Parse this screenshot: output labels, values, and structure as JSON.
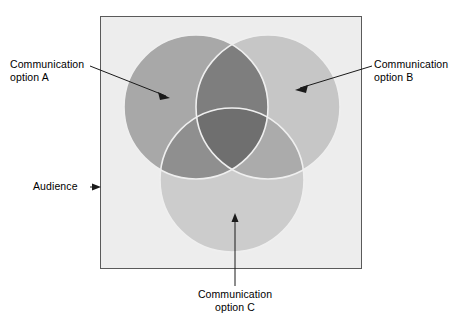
{
  "figure": {
    "type": "venn-diagram-3-set",
    "container_label": "Audience",
    "sets": [
      {
        "id": "A",
        "label": "Communication\noption A",
        "fill": "#a8a8a8"
      },
      {
        "id": "B",
        "label": "Communication\noption B",
        "fill": "#c6c6c6"
      },
      {
        "id": "C",
        "label": "Communication\noption C",
        "fill": "#cccccc"
      }
    ],
    "colors": {
      "background": "#ffffff",
      "audience_fill": "#ededed",
      "audience_border": "#5a5a5a",
      "circle_a": "#a8a8a8",
      "circle_b": "#c6c6c6",
      "circle_c": "#cccccc",
      "overlap_ab": "#7e7e7e",
      "overlap_ac": "#909090",
      "overlap_bc": "#aaaaaa",
      "overlap_abc": "#6f6f6f",
      "circle_outline": "#efefef",
      "text": "#000000",
      "leader_line": "#1a1a1a"
    },
    "labels": {
      "option_a": "Communication\noption A",
      "option_b": "Communication\noption B",
      "option_c": "Communication\noption C",
      "audience": "Audience"
    }
  }
}
